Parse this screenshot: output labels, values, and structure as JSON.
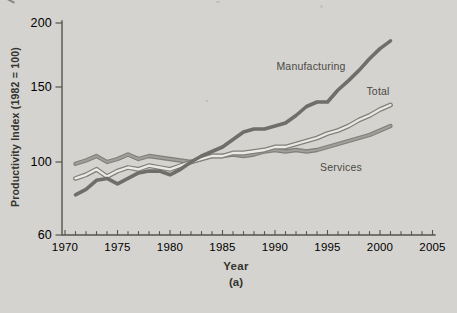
{
  "figure": {
    "caption": "(a)"
  },
  "chart_data": {
    "type": "line",
    "title": "",
    "xlabel": "Year",
    "ylabel": "Productivity Index (1982 = 100)",
    "xlim": [
      1970,
      2005
    ],
    "ylim": [
      60,
      200
    ],
    "x_ticks": [
      1970,
      1975,
      1980,
      1985,
      1990,
      1995,
      2000,
      2005
    ],
    "y_ticks": [
      200,
      150,
      100,
      60
    ],
    "grid": false,
    "legend_position": "inline-annotations",
    "x": [
      1971,
      1972,
      1973,
      1974,
      1975,
      1976,
      1977,
      1978,
      1979,
      1980,
      1981,
      1982,
      1983,
      1984,
      1985,
      1986,
      1987,
      1988,
      1989,
      1990,
      1991,
      1992,
      1993,
      1994,
      1995,
      1996,
      1997,
      1998,
      1999,
      2000,
      2001
    ],
    "series": [
      {
        "name": "Manufacturing",
        "style": "solid-dark",
        "values": [
          82,
          85,
          90,
          91,
          88,
          91,
          94,
          95,
          95,
          93,
          96,
          100,
          104,
          107,
          110,
          115,
          120,
          122,
          122,
          124,
          126,
          131,
          137,
          140,
          140,
          148,
          155,
          163,
          172,
          180,
          186
        ]
      },
      {
        "name": "Total",
        "style": "outlined-light",
        "values": [
          91,
          93,
          96,
          92,
          95,
          97,
          96,
          98,
          97,
          96,
          98,
          100,
          102,
          104,
          104,
          106,
          106,
          107,
          108,
          110,
          110,
          112,
          114,
          116,
          119,
          121,
          124,
          128,
          131,
          135,
          138
        ]
      },
      {
        "name": "Services",
        "style": "solid-gray",
        "values": [
          99,
          101,
          104,
          100,
          102,
          105,
          102,
          104,
          103,
          102,
          101,
          100,
          102,
          104,
          104,
          105,
          104,
          105,
          107,
          108,
          107,
          108,
          107,
          108,
          110,
          112,
          114,
          116,
          118,
          121,
          124
        ]
      }
    ]
  },
  "colors": {
    "background": "#d4d3cf",
    "axis": "#55544e",
    "tick_text": "#3e3d37",
    "title_text": "#35342e",
    "label_text": "#4a4944",
    "manufacturing_line": "#6f6e6a",
    "total_outline": "#81807b",
    "total_fill": "#eceae5",
    "services_outline": "#807f7a",
    "services_fill": "#a19f9a",
    "artifact": "#6e6d69",
    "speck": "#a9a8a4"
  }
}
